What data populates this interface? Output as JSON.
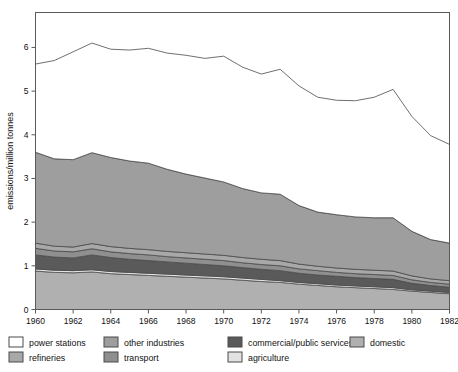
{
  "chart_data": {
    "type": "area",
    "stacked": true,
    "title": "",
    "xlabel": "",
    "ylabel": "emissions/million tonnes",
    "xlim": [
      1960,
      1982
    ],
    "ylim": [
      0,
      6.8
    ],
    "yticks": [
      0,
      1,
      2,
      3,
      4,
      5,
      6
    ],
    "xticks": [
      1960,
      1962,
      1964,
      1966,
      1968,
      1970,
      1972,
      1974,
      1976,
      1978,
      1980,
      1982
    ],
    "xtick_labels": [
      "1960",
      "1962",
      "1964",
      "1966",
      "1968",
      "1970",
      "1972",
      "1974",
      "1976",
      "1978",
      "1980",
      "1982"
    ],
    "ytick_labels": [
      "0",
      "1",
      "2",
      "3",
      "4",
      "5",
      "6"
    ],
    "grid": false,
    "legend_position": "below",
    "x": [
      1960,
      1961,
      1962,
      1963,
      1964,
      1965,
      1966,
      1967,
      1968,
      1969,
      1970,
      1971,
      1972,
      1973,
      1974,
      1975,
      1976,
      1977,
      1978,
      1979,
      1980,
      1981,
      1982
    ],
    "series": [
      {
        "name": "domestic",
        "color": "#b0b0b0",
        "values": [
          0.88,
          0.85,
          0.84,
          0.86,
          0.82,
          0.8,
          0.78,
          0.76,
          0.74,
          0.72,
          0.7,
          0.67,
          0.64,
          0.62,
          0.58,
          0.55,
          0.52,
          0.5,
          0.48,
          0.46,
          0.42,
          0.39,
          0.36
        ]
      },
      {
        "name": "agriculture",
        "color": "#e2e2e2",
        "values": [
          0.05,
          0.05,
          0.05,
          0.05,
          0.05,
          0.05,
          0.05,
          0.05,
          0.05,
          0.05,
          0.05,
          0.05,
          0.05,
          0.04,
          0.04,
          0.04,
          0.04,
          0.04,
          0.04,
          0.04,
          0.03,
          0.03,
          0.03
        ]
      },
      {
        "name": "commercial/public services",
        "color": "#5a5a5a",
        "values": [
          0.32,
          0.3,
          0.29,
          0.34,
          0.32,
          0.3,
          0.29,
          0.28,
          0.27,
          0.26,
          0.25,
          0.24,
          0.23,
          0.23,
          0.21,
          0.2,
          0.2,
          0.19,
          0.19,
          0.19,
          0.15,
          0.13,
          0.12
        ]
      },
      {
        "name": "transport",
        "color": "#8f8f8f",
        "values": [
          0.15,
          0.14,
          0.14,
          0.14,
          0.13,
          0.13,
          0.13,
          0.12,
          0.12,
          0.12,
          0.12,
          0.11,
          0.11,
          0.11,
          0.1,
          0.1,
          0.09,
          0.09,
          0.09,
          0.09,
          0.08,
          0.07,
          0.07
        ]
      },
      {
        "name": "refineries",
        "color": "#a8a8a8",
        "values": [
          0.12,
          0.11,
          0.11,
          0.12,
          0.12,
          0.12,
          0.12,
          0.12,
          0.12,
          0.12,
          0.12,
          0.12,
          0.12,
          0.12,
          0.11,
          0.1,
          0.1,
          0.1,
          0.1,
          0.1,
          0.09,
          0.08,
          0.08
        ]
      },
      {
        "name": "other industries",
        "color": "#9e9e9e",
        "values": [
          2.08,
          2.0,
          2.0,
          2.08,
          2.04,
          2.0,
          1.98,
          1.88,
          1.8,
          1.74,
          1.68,
          1.58,
          1.52,
          1.52,
          1.34,
          1.24,
          1.22,
          1.2,
          1.2,
          1.22,
          1.02,
          0.9,
          0.86
        ]
      },
      {
        "name": "power stations",
        "color": "#ffffff",
        "values": [
          2.02,
          2.25,
          2.47,
          2.51,
          2.48,
          2.54,
          2.63,
          2.66,
          2.72,
          2.74,
          2.88,
          2.78,
          2.72,
          2.86,
          2.74,
          2.63,
          2.62,
          2.66,
          2.76,
          2.94,
          2.63,
          2.38,
          2.26
        ]
      }
    ],
    "totals": [
      5.62,
      5.7,
      5.9,
      6.1,
      5.96,
      5.94,
      5.98,
      5.87,
      5.82,
      5.75,
      5.8,
      5.55,
      5.39,
      5.5,
      5.12,
      4.86,
      4.79,
      4.78,
      4.86,
      5.04,
      4.42,
      3.98,
      3.78
    ]
  },
  "legend": {
    "items": [
      {
        "label": "power stations",
        "color": "#ffffff"
      },
      {
        "label": "other industries",
        "color": "#9e9e9e"
      },
      {
        "label": "commercial/public services",
        "color": "#5a5a5a"
      },
      {
        "label": "domestic",
        "color": "#b0b0b0"
      },
      {
        "label": "refineries",
        "color": "#a8a8a8"
      },
      {
        "label": "transport",
        "color": "#8f8f8f"
      },
      {
        "label": "agriculture",
        "color": "#e2e2e2"
      }
    ]
  },
  "axis": {
    "y_title": "emissions/million tonnes"
  },
  "caption": {
    "text": ""
  },
  "colors": {
    "frame": "#5a5a5a",
    "series_outline": "#4a4a4a",
    "text": "#111111"
  }
}
